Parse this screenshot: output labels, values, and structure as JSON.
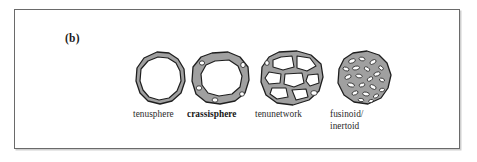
{
  "figure": {
    "panel_label": "(b)",
    "frame_color": "#6a6a6a",
    "background_color": "#ffffff",
    "wall_fill_color": "#a0a0a0",
    "outline_color": "#1f1f1f",
    "lumen_color": "#ffffff"
  },
  "specimens": [
    {
      "id": "tenusphere",
      "label": "tenusphere",
      "icon": "thin-walled-sphere-icon",
      "description": "thin-walled rounded polygon ring with single large lumen"
    },
    {
      "id": "crassisphere",
      "label": "crassisphere",
      "icon": "thick-walled-sphere-icon",
      "description": "thick-walled rounded polygon ring with large central lumen and small wall pores"
    },
    {
      "id": "tenunetwork",
      "label": "tenunetwork",
      "icon": "network-cells-icon",
      "description": "blob with network of thin walls enclosing several large irregular lumens"
    },
    {
      "id": "fusinoid-inertoid",
      "label_line1": "fusinoid/",
      "label_line2": "inertoid",
      "icon": "dense-fusinoid-icon",
      "description": "dense grey blob with many small elongate lumens"
    }
  ]
}
